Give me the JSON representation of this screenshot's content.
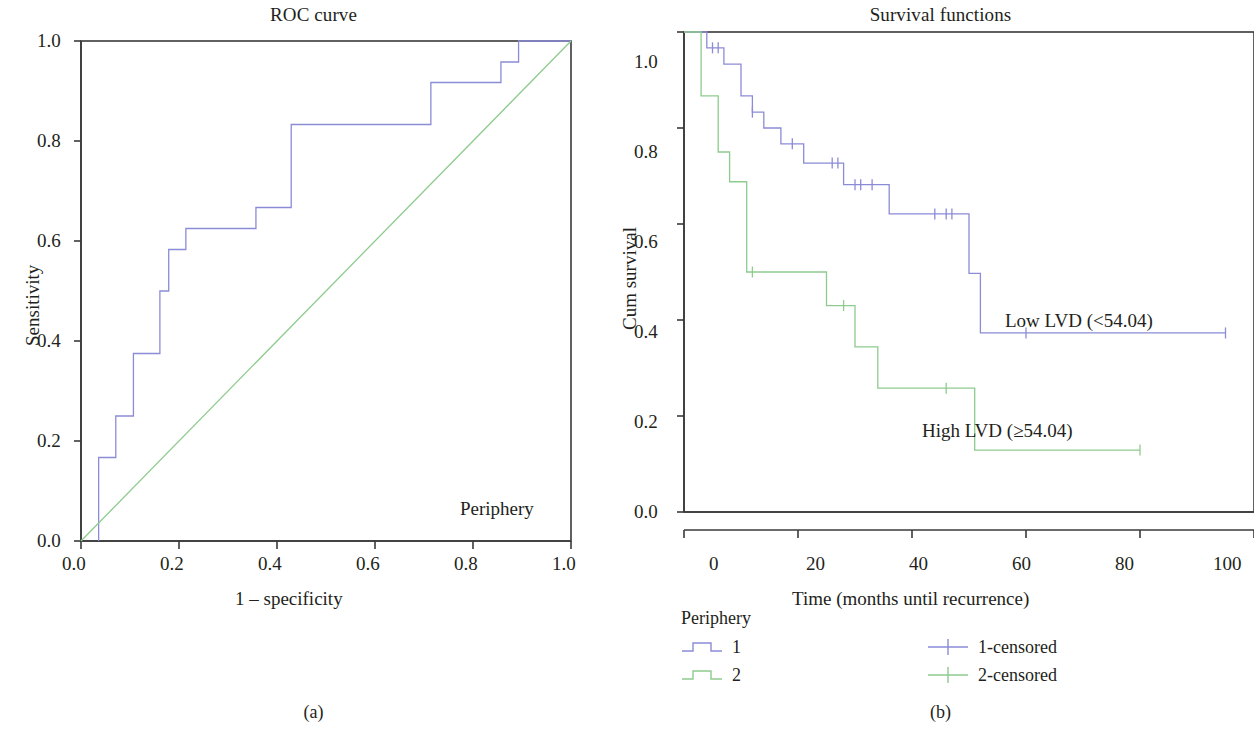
{
  "figure": {
    "subcaption_a": "(a)",
    "subcaption_b": "(b)"
  },
  "colors": {
    "series1_blue": "#8b8bd8",
    "series2_green": "#8ecb8e",
    "axis": "#3a3a3a",
    "text": "#231f20"
  },
  "panel_a": {
    "title": "ROC curve",
    "xlabel": "1 – specificity",
    "ylabel": "Sensitivity",
    "annotation": "Periphery",
    "xticks": [
      "0.0",
      "0.2",
      "0.4",
      "0.6",
      "0.8",
      "1.0"
    ],
    "yticks": [
      "0.0",
      "0.2",
      "0.4",
      "0.6",
      "0.8",
      "1.0"
    ]
  },
  "panel_b": {
    "title": "Survival functions",
    "xlabel": "Time (months until recurrence)",
    "ylabel": "Cum survival",
    "xticks": [
      "0",
      "20",
      "40",
      "60",
      "80",
      "100"
    ],
    "yticks": [
      "0.0",
      "0.2",
      "0.4",
      "0.6",
      "0.8",
      "1.0"
    ],
    "annotation_low": "Low LVD (<54.04)",
    "annotation_high": "High LVD (≥54.04)",
    "legend": {
      "title": "Periphery",
      "items": [
        {
          "label": "1",
          "color": "#8b8bd8",
          "kind": "step"
        },
        {
          "label": "2",
          "color": "#8ecb8e",
          "kind": "step"
        }
      ],
      "censored_items": [
        {
          "label": "1-censored",
          "color": "#8b8bd8",
          "kind": "cross"
        },
        {
          "label": "2-censored",
          "color": "#8ecb8e",
          "kind": "cross"
        }
      ]
    }
  },
  "chart_data": [
    {
      "type": "line",
      "subplot": "(a)",
      "title": "ROC curve",
      "xlabel": "1 – specificity",
      "ylabel": "Sensitivity",
      "xlim": [
        0.0,
        1.0
      ],
      "ylim": [
        0.0,
        1.0
      ],
      "xticks": [
        0.0,
        0.2,
        0.4,
        0.6,
        0.8,
        1.0
      ],
      "yticks": [
        0.0,
        0.2,
        0.4,
        0.6,
        0.8,
        1.0
      ],
      "grid": false,
      "annotations": [
        "Periphery"
      ],
      "series": [
        {
          "name": "ROC curve",
          "color": "#8b8bd8",
          "drawstyle": "steps-post",
          "points": [
            [
              0.036,
              0.0
            ],
            [
              0.036,
              0.167
            ],
            [
              0.071,
              0.167
            ],
            [
              0.071,
              0.25
            ],
            [
              0.107,
              0.25
            ],
            [
              0.107,
              0.375
            ],
            [
              0.161,
              0.375
            ],
            [
              0.161,
              0.5
            ],
            [
              0.179,
              0.5
            ],
            [
              0.179,
              0.583
            ],
            [
              0.214,
              0.583
            ],
            [
              0.214,
              0.625
            ],
            [
              0.357,
              0.625
            ],
            [
              0.357,
              0.667
            ],
            [
              0.429,
              0.667
            ],
            [
              0.429,
              0.833
            ],
            [
              0.714,
              0.833
            ],
            [
              0.714,
              0.917
            ],
            [
              0.857,
              0.917
            ],
            [
              0.857,
              0.958
            ],
            [
              0.893,
              0.958
            ],
            [
              0.893,
              1.0
            ],
            [
              1.0,
              1.0
            ]
          ]
        },
        {
          "name": "Reference line",
          "color": "#8ecb8e",
          "drawstyle": "line",
          "points": [
            [
              0.0,
              0.0
            ],
            [
              1.0,
              1.0
            ]
          ]
        }
      ]
    },
    {
      "type": "line",
      "subplot": "(b)",
      "title": "Survival functions",
      "xlabel": "Time (months until recurrence)",
      "ylabel": "Cum survival",
      "xlim": [
        0,
        100
      ],
      "ylim": [
        0.0,
        1.0
      ],
      "xticks": [
        0,
        20,
        40,
        60,
        80,
        100
      ],
      "yticks": [
        0.0,
        0.2,
        0.4,
        0.6,
        0.8,
        1.0
      ],
      "grid": false,
      "legend_position": "below",
      "annotations": [
        "Low LVD (<54.04)",
        "High LVD (≥54.04)"
      ],
      "series": [
        {
          "name": "1",
          "alias": "Low LVD (<54.04)",
          "color": "#8b8bd8",
          "drawstyle": "steps-post",
          "points": [
            [
              0,
              1.0
            ],
            [
              4,
              1.0
            ],
            [
              4,
              0.967
            ],
            [
              7,
              0.967
            ],
            [
              7,
              0.933
            ],
            [
              10,
              0.933
            ],
            [
              10,
              0.867
            ],
            [
              12,
              0.867
            ],
            [
              12,
              0.833
            ],
            [
              14,
              0.833
            ],
            [
              14,
              0.8
            ],
            [
              17,
              0.8
            ],
            [
              17,
              0.767
            ],
            [
              21,
              0.767
            ],
            [
              21,
              0.727
            ],
            [
              28,
              0.727
            ],
            [
              28,
              0.682
            ],
            [
              36,
              0.682
            ],
            [
              36,
              0.621
            ],
            [
              50,
              0.621
            ],
            [
              50,
              0.497
            ],
            [
              52,
              0.497
            ],
            [
              52,
              0.373
            ],
            [
              95,
              0.373
            ]
          ],
          "censored_times": [
            5,
            6,
            12,
            19,
            26,
            27,
            30,
            31,
            33,
            44,
            46,
            47,
            60,
            95
          ]
        },
        {
          "name": "2",
          "alias": "High LVD (≥54.04)",
          "color": "#8ecb8e",
          "drawstyle": "steps-post",
          "points": [
            [
              0,
              1.0
            ],
            [
              3,
              1.0
            ],
            [
              3,
              0.867
            ],
            [
              6,
              0.867
            ],
            [
              6,
              0.75
            ],
            [
              8,
              0.75
            ],
            [
              8,
              0.688
            ],
            [
              11,
              0.688
            ],
            [
              11,
              0.5
            ],
            [
              25,
              0.5
            ],
            [
              25,
              0.43
            ],
            [
              30,
              0.43
            ],
            [
              30,
              0.344
            ],
            [
              34,
              0.344
            ],
            [
              34,
              0.258
            ],
            [
              51,
              0.258
            ],
            [
              51,
              0.129
            ],
            [
              80,
              0.129
            ]
          ],
          "censored_times": [
            12,
            28,
            46,
            80
          ]
        }
      ]
    }
  ]
}
